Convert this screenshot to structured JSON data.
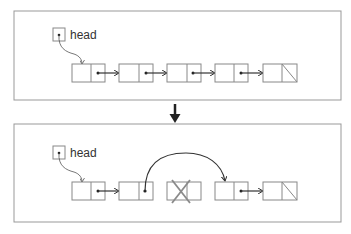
{
  "colors": {
    "panel_border": "#999999",
    "node_border": "#888888",
    "pointer": "#333333",
    "deleted_mark": "#8a8a8a",
    "arrow": "#222222"
  },
  "before": {
    "head_label": "head",
    "nodes": [
      {
        "id": "n1",
        "null_pointer": false
      },
      {
        "id": "n2",
        "null_pointer": false
      },
      {
        "id": "n3",
        "null_pointer": false
      },
      {
        "id": "n4",
        "null_pointer": false
      },
      {
        "id": "n5",
        "null_pointer": true
      }
    ]
  },
  "transition": {
    "direction": "down"
  },
  "after": {
    "head_label": "head",
    "nodes": [
      {
        "id": "n1",
        "null_pointer": false
      },
      {
        "id": "n2",
        "null_pointer": false,
        "skips_to": "n4"
      },
      {
        "id": "n3",
        "deleted": true
      },
      {
        "id": "n4",
        "null_pointer": false
      },
      {
        "id": "n5",
        "null_pointer": true
      }
    ]
  }
}
